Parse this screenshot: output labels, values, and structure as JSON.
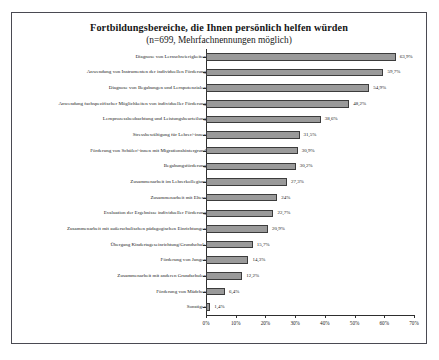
{
  "chart_data": {
    "type": "bar",
    "orientation": "horizontal",
    "title": "Fortbildungsbereiche, die Ihnen persönlich helfen würden",
    "subtitle": "(n=699, Mehrfachnennungen möglich)",
    "xlabel": "",
    "ylabel": "",
    "xlim": [
      0,
      70
    ],
    "grid": false,
    "legend": null,
    "xticks": [
      "0%",
      "10%",
      "20%",
      "30%",
      "40%",
      "50%",
      "60%",
      "70%"
    ],
    "xtick_values": [
      0,
      10,
      20,
      30,
      40,
      50,
      60,
      70
    ],
    "categories": [
      "Diagnose von Lernschwierigkeiten",
      "Anwendung von Instrumenten der individuellen Förderung",
      "Diagnose von Begabungen und Lernpotenzialen",
      "Anwendung fachspezifischer Möglichkeiten von individueller Förderung",
      "Lernprozessbeobachtung und Leistungsbeurteilung",
      "Stressbewältigung für Lehrer/-innen",
      "Förderung von Schüler/-innen mit Migrationshintergrund",
      "Begabungsförderung",
      "Zusammenarbeit im Lehrerkollegium",
      "Zusammenarbeit mit Eltern",
      "Evaluation der Ergebnisse individueller Förderung",
      "Zusammenarbeit mit außerschulischen pädagogischen Einrichtungen",
      "Übergang Kindertageseinrichtung/Grundschule",
      "Förderung von Jungen",
      "Zusammenarbeit mit anderen Grundschulen",
      "Förderung von Mädchen",
      "Sonstiges"
    ],
    "values": [
      63.9,
      59.7,
      54.9,
      48.2,
      38.6,
      31.5,
      30.9,
      30.2,
      27.3,
      24.0,
      22.7,
      20.9,
      15.7,
      14.3,
      12.2,
      6.4,
      1.4
    ],
    "value_labels": [
      "63,9%",
      "59,7%",
      "54,9%",
      "48,2%",
      "38,6%",
      "31,5%",
      "30,9%",
      "30,2%",
      "27,3%",
      "24%",
      "22,7%",
      "20,9%",
      "15,7%",
      "14,3%",
      "12,2%",
      "6,4%",
      "1,4%"
    ],
    "bar_color": "#9a9a9a",
    "bar_edge_color": "#3c3c3c"
  }
}
